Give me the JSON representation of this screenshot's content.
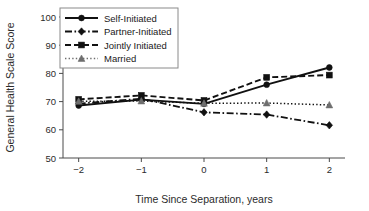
{
  "chart_data": {
    "type": "line",
    "title": "",
    "xlabel": "Time Since Separation, years",
    "ylabel": "General Health Scale Score",
    "x": [
      -2,
      -1,
      0,
      1,
      2
    ],
    "xticklabels": [
      "−2",
      "−1",
      "0",
      "1",
      "2"
    ],
    "yticks": [
      50,
      60,
      70,
      80,
      90,
      100
    ],
    "yticklabels": [
      "50",
      "60",
      "70",
      "80",
      "90",
      "100"
    ],
    "xlim": [
      -2.25,
      2.25
    ],
    "ylim": [
      50,
      100
    ],
    "grid": false,
    "legend_position": "upper-left-inside",
    "series": [
      {
        "name": "Self-Initiated",
        "values": [
          68.6,
          70.7,
          69.2,
          76.0,
          82.1
        ],
        "marker": "circle",
        "linestyle": "solid",
        "color": "#111111"
      },
      {
        "name": "Partner-Initiated",
        "values": [
          69.3,
          71.0,
          66.2,
          65.4,
          61.6
        ],
        "marker": "diamond",
        "linestyle": "dashdot",
        "color": "#111111"
      },
      {
        "name": "Jointly Initiated",
        "values": [
          70.8,
          72.2,
          70.4,
          78.6,
          79.4
        ],
        "marker": "square",
        "linestyle": "dashed",
        "color": "#111111"
      },
      {
        "name": "Married",
        "values": [
          70.1,
          70.2,
          69.4,
          69.5,
          68.8
        ],
        "marker": "triangle",
        "linestyle": "dotted",
        "color": "#6e6e6e"
      }
    ]
  },
  "legend": {
    "entries": [
      {
        "label": "Self-Initiated"
      },
      {
        "label": "Partner-Initiated"
      },
      {
        "label": "Jointly Initiated"
      },
      {
        "label": "Married"
      }
    ]
  }
}
